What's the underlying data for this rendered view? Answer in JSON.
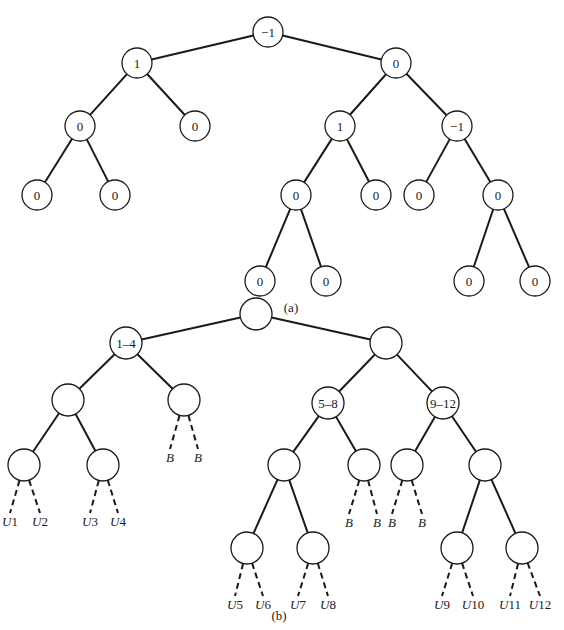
{
  "figure": {
    "panels": [
      {
        "id": "a",
        "caption": "(a)",
        "caption_pos": [
          291,
          312
        ],
        "node_radius": 15,
        "nodes": [
          {
            "id": "a0",
            "label": "−1",
            "x": 268,
            "y": 32
          },
          {
            "id": "a1",
            "label": "1",
            "x": 137,
            "y": 63
          },
          {
            "id": "a2",
            "label": "0",
            "x": 396,
            "y": 63
          },
          {
            "id": "a3",
            "label": "0",
            "x": 80,
            "y": 126
          },
          {
            "id": "a4",
            "label": "0",
            "x": 195,
            "y": 126
          },
          {
            "id": "a5",
            "label": "1",
            "x": 340,
            "y": 126
          },
          {
            "id": "a6",
            "label": "−1",
            "x": 457,
            "y": 126
          },
          {
            "id": "a7",
            "label": "0",
            "x": 37,
            "y": 195
          },
          {
            "id": "a8",
            "label": "0",
            "x": 115,
            "y": 195
          },
          {
            "id": "a9",
            "label": "0",
            "x": 296,
            "y": 195
          },
          {
            "id": "a10",
            "label": "0",
            "x": 376,
            "y": 195
          },
          {
            "id": "a11",
            "label": "0",
            "x": 419,
            "y": 195
          },
          {
            "id": "a12",
            "label": "0",
            "x": 498,
            "y": 195
          },
          {
            "id": "a13",
            "label": "0",
            "x": 260,
            "y": 281
          },
          {
            "id": "a14",
            "label": "0",
            "x": 326,
            "y": 281
          },
          {
            "id": "a15",
            "label": "0",
            "x": 469,
            "y": 281
          },
          {
            "id": "a16",
            "label": "0",
            "x": 535,
            "y": 281
          }
        ],
        "edges": [
          [
            "a0",
            "a1"
          ],
          [
            "a0",
            "a2"
          ],
          [
            "a1",
            "a3"
          ],
          [
            "a1",
            "a4"
          ],
          [
            "a2",
            "a5"
          ],
          [
            "a2",
            "a6"
          ],
          [
            "a3",
            "a7"
          ],
          [
            "a3",
            "a8"
          ],
          [
            "a5",
            "a9"
          ],
          [
            "a5",
            "a10"
          ],
          [
            "a6",
            "a11"
          ],
          [
            "a6",
            "a12"
          ],
          [
            "a9",
            "a13"
          ],
          [
            "a9",
            "a14"
          ],
          [
            "a12",
            "a15"
          ],
          [
            "a12",
            "a16"
          ]
        ]
      },
      {
        "id": "b",
        "caption": "(b)",
        "caption_pos": [
          279,
          620
        ],
        "node_radius": 16,
        "nodes": [
          {
            "id": "b0",
            "label": "",
            "x": 256,
            "y": 314
          },
          {
            "id": "b1",
            "label": "1–4",
            "x": 126,
            "y": 343
          },
          {
            "id": "b2",
            "label": "",
            "x": 386,
            "y": 343
          },
          {
            "id": "b3",
            "label": "",
            "x": 68,
            "y": 400
          },
          {
            "id": "b4",
            "label": "",
            "x": 184,
            "y": 400
          },
          {
            "id": "b5",
            "label": "5–8",
            "x": 328,
            "y": 403
          },
          {
            "id": "b6",
            "label": "9–12",
            "x": 443,
            "y": 403
          },
          {
            "id": "b7",
            "label": "",
            "x": 24,
            "y": 465
          },
          {
            "id": "b8",
            "label": "",
            "x": 103,
            "y": 465
          },
          {
            "id": "b9",
            "label": "",
            "x": 284,
            "y": 465
          },
          {
            "id": "b10",
            "label": "",
            "x": 364,
            "y": 465
          },
          {
            "id": "b11",
            "label": "",
            "x": 407,
            "y": 465
          },
          {
            "id": "b12",
            "label": "",
            "x": 485,
            "y": 465
          },
          {
            "id": "b13",
            "label": "",
            "x": 247,
            "y": 548
          },
          {
            "id": "b14",
            "label": "",
            "x": 313,
            "y": 548
          },
          {
            "id": "b15",
            "label": "",
            "x": 457,
            "y": 548
          },
          {
            "id": "b16",
            "label": "",
            "x": 522,
            "y": 548
          }
        ],
        "edges": [
          [
            "b0",
            "b1"
          ],
          [
            "b0",
            "b2"
          ],
          [
            "b1",
            "b3"
          ],
          [
            "b1",
            "b4"
          ],
          [
            "b2",
            "b5"
          ],
          [
            "b2",
            "b6"
          ],
          [
            "b3",
            "b7"
          ],
          [
            "b3",
            "b8"
          ],
          [
            "b5",
            "b9"
          ],
          [
            "b5",
            "b10"
          ],
          [
            "b6",
            "b11"
          ],
          [
            "b6",
            "b12"
          ],
          [
            "b9",
            "b13"
          ],
          [
            "b9",
            "b14"
          ],
          [
            "b12",
            "b15"
          ],
          [
            "b12",
            "b16"
          ]
        ],
        "dashed_leaves": [
          {
            "parent": "b7",
            "letter": "U",
            "num": "1",
            "x": 10,
            "y": 526
          },
          {
            "parent": "b7",
            "letter": "U",
            "num": "2",
            "x": 40,
            "y": 526
          },
          {
            "parent": "b8",
            "letter": "U",
            "num": "3",
            "x": 90,
            "y": 526
          },
          {
            "parent": "b8",
            "letter": "U",
            "num": "4",
            "x": 118,
            "y": 526
          },
          {
            "parent": "b4",
            "letter": "B",
            "num": "",
            "x": 170,
            "y": 462
          },
          {
            "parent": "b4",
            "letter": "B",
            "num": "",
            "x": 198,
            "y": 462
          },
          {
            "parent": "b10",
            "letter": "B",
            "num": "",
            "x": 349,
            "y": 527
          },
          {
            "parent": "b10",
            "letter": "B",
            "num": "",
            "x": 377,
            "y": 527
          },
          {
            "parent": "b11",
            "letter": "B",
            "num": "",
            "x": 392,
            "y": 527
          },
          {
            "parent": "b11",
            "letter": "B",
            "num": "",
            "x": 422,
            "y": 527
          },
          {
            "parent": "b13",
            "letter": "U",
            "num": "5",
            "x": 235,
            "y": 609
          },
          {
            "parent": "b13",
            "letter": "U",
            "num": "6",
            "x": 263,
            "y": 609
          },
          {
            "parent": "b14",
            "letter": "U",
            "num": "7",
            "x": 298,
            "y": 609
          },
          {
            "parent": "b14",
            "letter": "U",
            "num": "8",
            "x": 328,
            "y": 609
          },
          {
            "parent": "b15",
            "letter": "U",
            "num": "9",
            "x": 442,
            "y": 609
          },
          {
            "parent": "b15",
            "letter": "U",
            "num": "10",
            "x": 473,
            "y": 609
          },
          {
            "parent": "b16",
            "letter": "U",
            "num": "11",
            "x": 510,
            "y": 609
          },
          {
            "parent": "b16",
            "letter": "U",
            "num": "12",
            "x": 540,
            "y": 609
          }
        ]
      }
    ]
  }
}
